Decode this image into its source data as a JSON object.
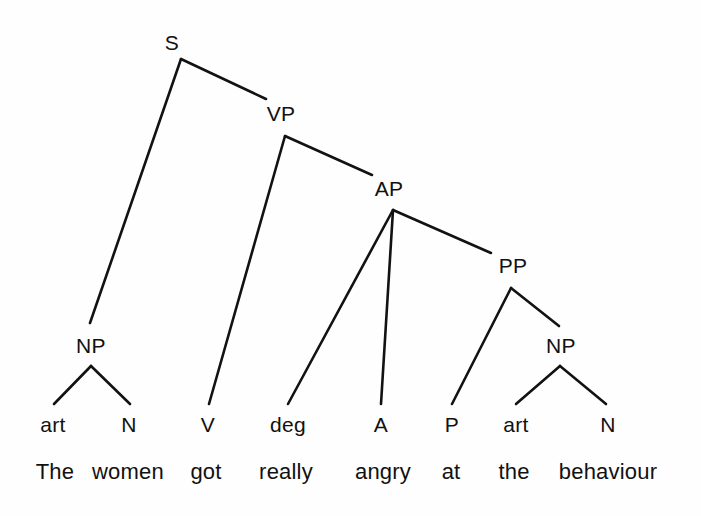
{
  "figure": {
    "name": "constituency-syntax-tree",
    "sentence": "The women got really angry at the behaviour",
    "background_color": "#fefefe",
    "line_color": "#121212",
    "text_color": "#111111"
  },
  "nodes": {
    "s": {
      "label": "S",
      "x": 172,
      "y": 50
    },
    "vp": {
      "label": "VP",
      "x": 281,
      "y": 121
    },
    "ap": {
      "label": "AP",
      "x": 389,
      "y": 196
    },
    "pp": {
      "label": "PP",
      "x": 513,
      "y": 273
    },
    "np_subject": {
      "label": "NP",
      "x": 91,
      "y": 353
    },
    "np_object": {
      "label": "NP",
      "x": 561,
      "y": 353
    }
  },
  "pos_tags": [
    {
      "label": "art",
      "x": 53,
      "y": 432
    },
    {
      "label": "N",
      "x": 129,
      "y": 432
    },
    {
      "label": "V",
      "x": 208,
      "y": 432
    },
    {
      "label": "deg",
      "x": 288,
      "y": 432
    },
    {
      "label": "A",
      "x": 381,
      "y": 432
    },
    {
      "label": "P",
      "x": 452,
      "y": 432
    },
    {
      "label": "art",
      "x": 516,
      "y": 432
    },
    {
      "label": "N",
      "x": 608,
      "y": 432
    }
  ],
  "words": [
    {
      "label": "The",
      "x": 55,
      "y": 479
    },
    {
      "label": "women",
      "x": 128,
      "y": 479
    },
    {
      "label": "got",
      "x": 206,
      "y": 479
    },
    {
      "label": "really",
      "x": 286,
      "y": 479
    },
    {
      "label": "angry",
      "x": 383,
      "y": 479
    },
    {
      "label": "at",
      "x": 451,
      "y": 479
    },
    {
      "label": "the",
      "x": 514,
      "y": 479
    },
    {
      "label": "behaviour",
      "x": 608,
      "y": 479
    }
  ],
  "branches": [
    {
      "name": "s-to-np-subject",
      "x1": 181,
      "y1": 59,
      "x2": 90,
      "y2": 323
    },
    {
      "name": "s-to-vp",
      "x1": 181,
      "y1": 59,
      "x2": 266,
      "y2": 99
    },
    {
      "name": "vp-to-v",
      "x1": 285,
      "y1": 136,
      "x2": 209,
      "y2": 404
    },
    {
      "name": "vp-to-ap",
      "x1": 285,
      "y1": 136,
      "x2": 372,
      "y2": 175
    },
    {
      "name": "ap-to-deg",
      "x1": 393,
      "y1": 210,
      "x2": 288,
      "y2": 404
    },
    {
      "name": "ap-to-a",
      "x1": 393,
      "y1": 210,
      "x2": 381,
      "y2": 404
    },
    {
      "name": "ap-to-pp",
      "x1": 393,
      "y1": 210,
      "x2": 491,
      "y2": 253
    },
    {
      "name": "pp-to-p",
      "x1": 511,
      "y1": 288,
      "x2": 452,
      "y2": 404
    },
    {
      "name": "pp-to-np-object",
      "x1": 511,
      "y1": 288,
      "x2": 559,
      "y2": 326
    },
    {
      "name": "np-subject-to-art",
      "x1": 91,
      "y1": 366,
      "x2": 54,
      "y2": 404
    },
    {
      "name": "np-subject-to-n",
      "x1": 91,
      "y1": 366,
      "x2": 130,
      "y2": 404
    },
    {
      "name": "np-object-to-art",
      "x1": 560,
      "y1": 366,
      "x2": 516,
      "y2": 404
    },
    {
      "name": "np-object-to-n",
      "x1": 560,
      "y1": 366,
      "x2": 606,
      "y2": 404
    }
  ]
}
